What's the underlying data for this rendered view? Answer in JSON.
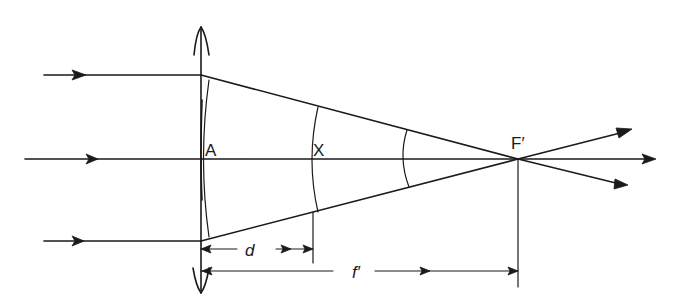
{
  "diagram": {
    "type": "optics-ray-diagram",
    "labels": {
      "lens_vertex": "A",
      "wavefront_point": "X",
      "focal_point": "F′",
      "distance_d": "d",
      "focal_length": "f′"
    },
    "elements": {
      "lens": {
        "kind": "converging lens (double-arrow symbol)",
        "position_x": 201
      },
      "incoming_rays": [
        {
          "name": "top-ray",
          "y": 75
        },
        {
          "name": "axis-ray",
          "y": 159
        },
        {
          "name": "bottom-ray",
          "y": 241
        }
      ],
      "wavefronts": [
        "at lens A",
        "at X (distance d from A)",
        "between X and F′"
      ],
      "dimensions": [
        {
          "label": "d",
          "from": "A",
          "to": "X"
        },
        {
          "label": "f′",
          "from": "A",
          "to": "F′"
        }
      ]
    },
    "colors": {
      "ink": "#1a1a1a",
      "background": "#ffffff"
    }
  }
}
